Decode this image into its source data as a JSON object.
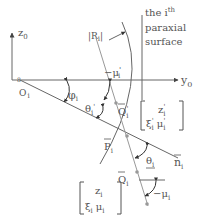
{
  "diagram": {
    "axes": {
      "z_label": "z",
      "z_sub": "0",
      "y_label": "y",
      "y_sub": "0",
      "origin_label": "O",
      "origin_sub": "i"
    },
    "surface": {
      "radius_label": "|R",
      "radius_sub": "i",
      "radius_close": "|",
      "title_line1_pre": "the i",
      "title_line1_sup": "th",
      "title_line2": "paraxial",
      "title_line3": "surface"
    },
    "angles": {
      "phi": "φ",
      "phi_sub": "i",
      "theta_prime": "θ",
      "theta_prime_sub": "i",
      "mu_prime": "−μ",
      "mu_prime_sub": "i",
      "mu_prime_mark": "'",
      "theta": "θ",
      "theta_sub": "i",
      "mu": "−μ",
      "mu_sub": "i"
    },
    "points": {
      "q_prime": "Q",
      "q_prime_sub": "i",
      "q_prime_mark": "'",
      "p": "P",
      "p_sub": "i",
      "q": "Q",
      "q_sub": "i",
      "normal": "n",
      "normal_sub": "i"
    },
    "vectors": {
      "out_row1": "z",
      "out_row1_sub": "i",
      "out_row1_mark": "'",
      "out_row2_a": "ξ",
      "out_row2_a_sub": "i",
      "out_row2_b": "μ",
      "out_row2_b_sub": "i",
      "in_row1": "z",
      "in_row1_sub": "i",
      "in_row2_a": "ξ",
      "in_row2_a_sub": "i",
      "in_row2_b": "μ",
      "in_row2_b_sub": "i"
    },
    "colors": {
      "line": "#555555",
      "ray": "#999999",
      "text": "#555555"
    }
  }
}
